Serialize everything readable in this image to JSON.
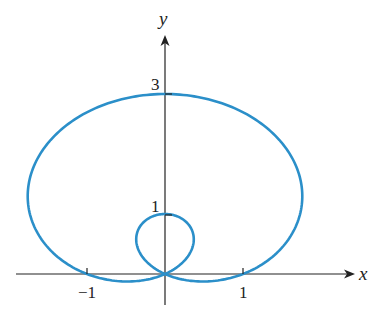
{
  "chart_data": {
    "type": "line",
    "title": "",
    "curve": "r = 1 + 2 sin θ (limaçon with inner loop)",
    "xlabel": "x",
    "ylabel": "y",
    "x_ticks": [
      {
        "value": -1,
        "label": "−1"
      },
      {
        "value": 1,
        "label": "1"
      }
    ],
    "y_ticks": [
      {
        "value": 1,
        "label": "1"
      },
      {
        "value": 3,
        "label": "3"
      }
    ],
    "xlim": [
      -2.0,
      2.4
    ],
    "ylim": [
      -0.4,
      4.0
    ],
    "grid": false,
    "legend": null,
    "polar": {
      "a": 1,
      "b": 2,
      "theta_range": [
        0,
        6.2832
      ]
    },
    "key_points": [
      {
        "x": 0,
        "y": 3,
        "note": "outer top"
      },
      {
        "x": 0,
        "y": 1,
        "note": "inner loop top"
      },
      {
        "x": -1,
        "y": 0
      },
      {
        "x": 1,
        "y": 0
      },
      {
        "x": 0,
        "y": 0,
        "note": "pole / loop crossing"
      }
    ],
    "line_color": "#2b8fc9"
  },
  "style": {
    "origin_px": [
      165,
      274
    ],
    "scale_x": 78,
    "scale_y": 60,
    "axis_color": "#222222"
  }
}
